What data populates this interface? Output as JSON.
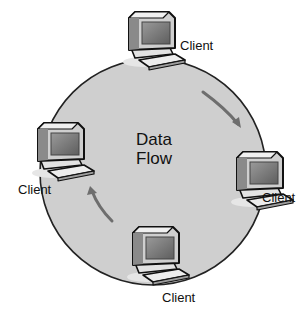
{
  "diagram": {
    "title_line1": "Data",
    "title_line2": "Flow",
    "ring": {
      "fill": "#cfcfcf",
      "stroke": "#222222"
    },
    "arrow_color": "#6e6e6e",
    "nodes": [
      {
        "id": "top",
        "label": "Client",
        "icon": "computer-icon"
      },
      {
        "id": "right",
        "label": "Client",
        "icon": "computer-icon"
      },
      {
        "id": "bottom",
        "label": "Client",
        "icon": "computer-icon"
      },
      {
        "id": "left",
        "label": "Client",
        "icon": "computer-icon"
      }
    ],
    "arrows": [
      {
        "from": "top",
        "to": "right",
        "direction": "clockwise"
      },
      {
        "from": "bottom",
        "to": "left",
        "direction": "clockwise"
      }
    ]
  }
}
